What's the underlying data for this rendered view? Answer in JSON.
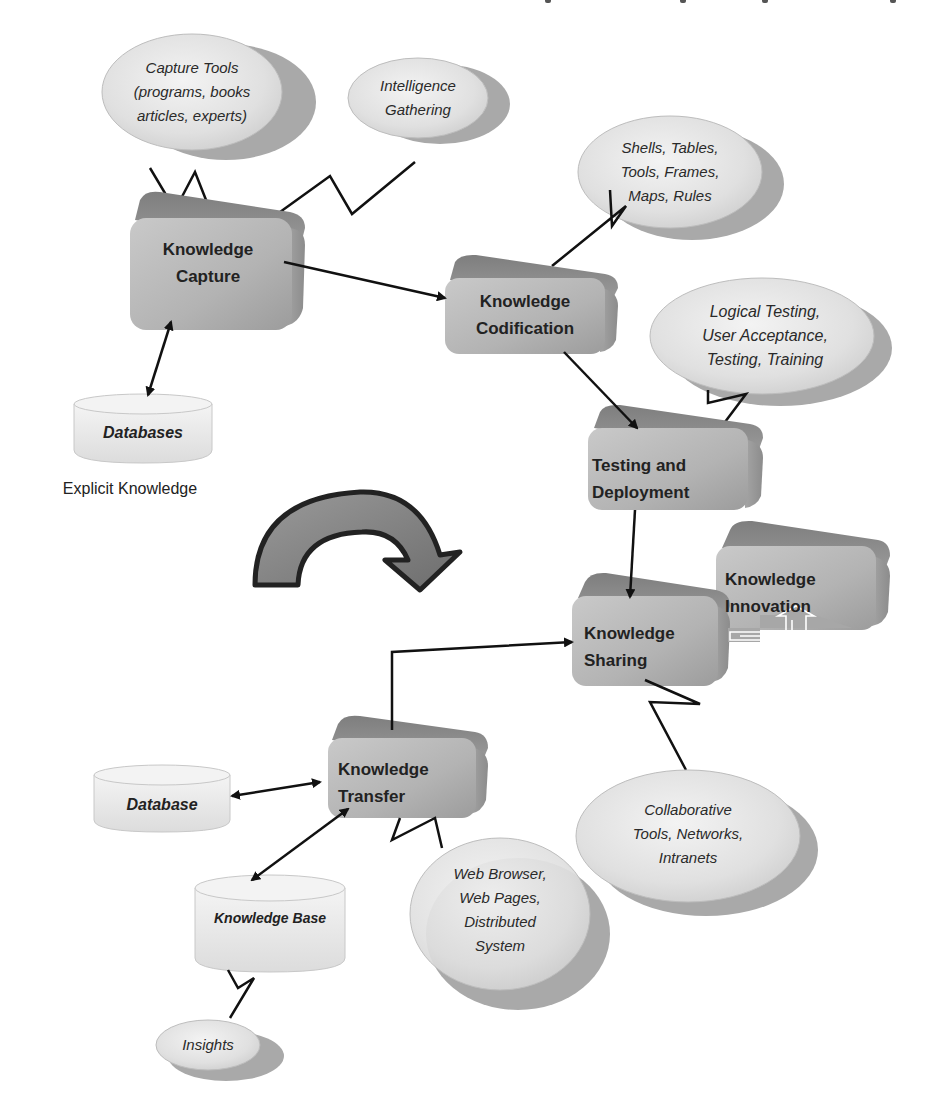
{
  "diagram": {
    "processes": {
      "capture": {
        "line1": "Knowledge",
        "line2": "Capture"
      },
      "codification": {
        "line1": "Knowledge",
        "line2": "Codification"
      },
      "testing": {
        "line1": "Testing and",
        "line2": "Deployment"
      },
      "sharing": {
        "line1": "Knowledge",
        "line2": "Sharing"
      },
      "innovation": {
        "line1": "Knowledge",
        "line2": "Innovation"
      },
      "transfer": {
        "line1": "Knowledge",
        "line2": "Transfer"
      }
    },
    "bubbles": {
      "capture_tools": [
        "Capture Tools",
        "(programs, books",
        "articles, experts)"
      ],
      "intelligence": [
        "Intelligence",
        "Gathering"
      ],
      "shells": [
        "Shells, Tables,",
        "Tools, Frames,",
        "Maps, Rules"
      ],
      "logical_testing": [
        "Logical Testing,",
        "User Acceptance,",
        "Testing, Training"
      ],
      "collaborative": [
        "Collaborative",
        "Tools, Networks,",
        "Intranets"
      ],
      "web_browser": [
        "Web Browser,",
        "Web Pages,",
        "Distributed",
        "System"
      ],
      "insights": [
        "Insights"
      ]
    },
    "databases": {
      "databases": "Databases",
      "database": "Database",
      "knowledge_base": "Knowledge Base"
    },
    "captions": {
      "explicit": "Explicit Knowledge"
    },
    "colors": {
      "box_front": "#b8b8b8",
      "box_top": "#8a8a8a",
      "bubble_fill": "#e2e2e2",
      "bubble_shadow": "#a8a8a8",
      "db_fill": "#ececec",
      "line": "#111111"
    }
  }
}
